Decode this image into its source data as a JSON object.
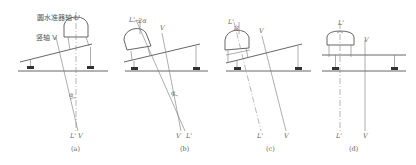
{
  "figure": {
    "panels": [
      {
        "id": "a",
        "caption": "(a)",
        "angle_label": "α",
        "axis_labels": [
          "L'",
          "V"
        ],
        "callouts": [
          "圆水准器轴 L'",
          "竖轴 V"
        ]
      },
      {
        "id": "b",
        "caption": "(b)",
        "angle_label": "α",
        "top_angle_label": "2α",
        "axis_labels": [
          "V",
          "L'"
        ],
        "top_labels": [
          "L'",
          "V"
        ]
      },
      {
        "id": "c",
        "caption": "(c)",
        "top_angle_label": "α",
        "axis_labels": [
          "L'",
          "V"
        ],
        "top_labels": [
          "L'",
          "V"
        ]
      },
      {
        "id": "d",
        "caption": "(d)",
        "axis_labels": [
          "L'",
          "V"
        ],
        "top_labels": [
          "L'",
          "V"
        ]
      }
    ]
  }
}
